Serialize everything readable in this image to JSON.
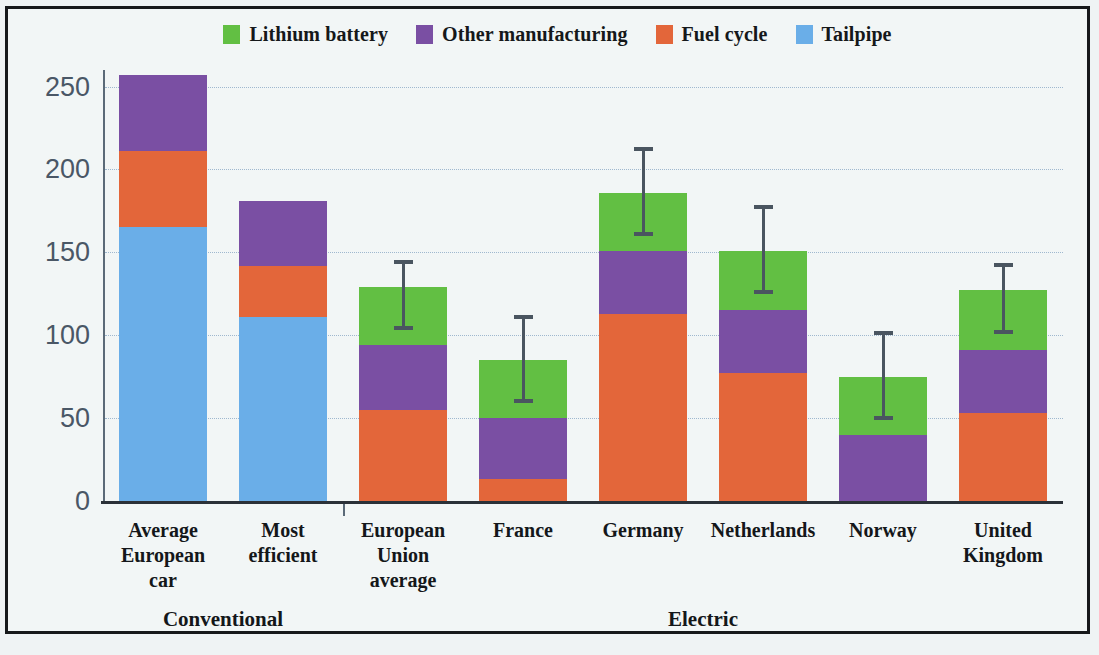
{
  "chart_data": {
    "type": "bar",
    "subtype": "stacked-bar-with-error-bars",
    "title": "",
    "xlabel": "",
    "ylabel": "CO2 emissions (g/km)",
    "ylabel_html": "CO<sub>2</sub> emissions (g/km)",
    "ylim": [
      0,
      260
    ],
    "yticks": [
      0,
      50,
      100,
      150,
      200,
      250
    ],
    "ytick_labels": [
      "0",
      "50",
      "100",
      "150",
      "200",
      "250"
    ],
    "grid": "horizontal-dotted",
    "legend_position": "top-center",
    "categories": [
      "Average European car",
      "Most efficient",
      "European Union average",
      "France",
      "Germany",
      "Netherlands",
      "Norway",
      "United Kingdom"
    ],
    "category_lines": [
      [
        "Average",
        "European",
        "car"
      ],
      [
        "Most",
        "efficient"
      ],
      [
        "European",
        "Union",
        "average"
      ],
      [
        "France"
      ],
      [
        "Germany"
      ],
      [
        "Netherlands"
      ],
      [
        "Norway"
      ],
      [
        "United",
        "Kingdom"
      ]
    ],
    "groups": [
      {
        "label": "Conventional",
        "categories": [
          "Average European car",
          "Most efficient"
        ]
      },
      {
        "label": "Electric",
        "categories": [
          "European Union average",
          "France",
          "Germany",
          "Netherlands",
          "Norway",
          "United Kingdom"
        ]
      }
    ],
    "series": [
      {
        "name": "Tailpipe",
        "color": "#6aaee8",
        "values": [
          165,
          111,
          0,
          0,
          0,
          0,
          0,
          0
        ]
      },
      {
        "name": "Fuel cycle",
        "color": "#e3663a",
        "values": [
          46,
          31,
          55,
          13,
          113,
          77,
          0,
          53
        ]
      },
      {
        "name": "Other manufacturing",
        "color": "#7a4fa3",
        "values": [
          46,
          39,
          39,
          37,
          38,
          38,
          40,
          38
        ]
      },
      {
        "name": "Lithium battery",
        "color": "#62bf43",
        "values": [
          0,
          0,
          35,
          35,
          35,
          36,
          35,
          36
        ]
      }
    ],
    "stack_order_bottom_to_top": [
      "Tailpipe",
      "Fuel cycle",
      "Other manufacturing",
      "Lithium battery"
    ],
    "totals": [
      257,
      181,
      129,
      85,
      186,
      151,
      75,
      127
    ],
    "error_bars": [
      null,
      null,
      {
        "low": 103,
        "high": 143
      },
      {
        "low": 59,
        "high": 110
      },
      {
        "low": 160,
        "high": 211
      },
      {
        "low": 125,
        "high": 176
      },
      {
        "low": 49,
        "high": 100
      },
      {
        "low": 101,
        "high": 141
      }
    ],
    "error_bar_color": "#4a5560"
  },
  "legend": {
    "items": [
      {
        "label": "Lithium battery",
        "color": "#62bf43"
      },
      {
        "label": "Other manufacturing",
        "color": "#7a4fa3"
      },
      {
        "label": "Fuel cycle",
        "color": "#e3663a"
      },
      {
        "label": "Tailpipe",
        "color": "#6aaee8"
      }
    ]
  },
  "axis": {
    "y_title_main": "CO",
    "y_title_sub": "2",
    "y_title_rest": " emissions (g/km)"
  }
}
